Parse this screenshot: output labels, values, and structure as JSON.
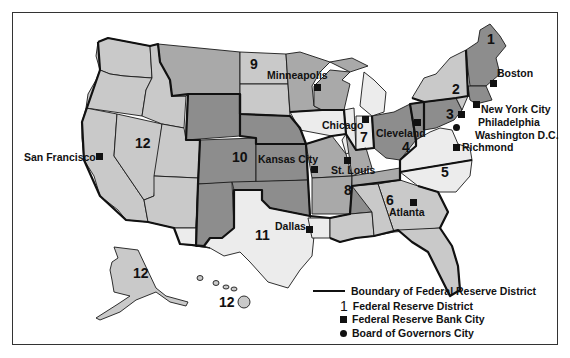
{
  "map": {
    "title": "Federal Reserve Districts",
    "colors": {
      "light_gray": "#c9c9c9",
      "mid_gray": "#a9a9a9",
      "dark_gray": "#8d8d8d",
      "near_white": "#ececec",
      "ink": "#111111"
    },
    "districts": [
      {
        "number": "1",
        "city": "Boston"
      },
      {
        "number": "2",
        "city": "New York City"
      },
      {
        "number": "3",
        "city": "Philadelphia"
      },
      {
        "number": "4",
        "city": "Cleveland"
      },
      {
        "number": "5",
        "city": "Richmond"
      },
      {
        "number": "6",
        "city": "Atlanta"
      },
      {
        "number": "7",
        "city": "Chicago"
      },
      {
        "number": "8",
        "city": "St. Louis"
      },
      {
        "number": "9",
        "city": "Minneapolis"
      },
      {
        "number": "10",
        "city": "Kansas City"
      },
      {
        "number": "11",
        "city": "Dallas"
      },
      {
        "number": "12",
        "city": "San Francisco"
      }
    ],
    "district_labels": {
      "d1": "1",
      "d2": "2",
      "d3": "3",
      "d4": "4",
      "d5": "5",
      "d6": "6",
      "d7": "7",
      "d8": "8",
      "d9": "9",
      "d10": "10",
      "d11": "11",
      "d12": "12",
      "d12_alaska": "12",
      "d12_hawaii": "12"
    },
    "city_labels": {
      "boston": "Boston",
      "new_york": "New York City",
      "philadelphia": "Philadelphia",
      "washington": "Washington D.C.",
      "richmond": "Richmond",
      "cleveland": "Cleveland",
      "chicago": "Chicago",
      "minneapolis": "Minneapolis",
      "kansas_city": "Kansas City",
      "st_louis": "St. Louis",
      "dallas": "Dallas",
      "atlanta": "Atlanta",
      "san_francisco": "San Francisco"
    }
  },
  "legend": {
    "boundary": "Boundary of Federal Reserve District",
    "district_symbol": "1",
    "district": "Federal Reserve District",
    "bank_city": "Federal Reserve Bank City",
    "governors_city": "Board of Governors City"
  }
}
